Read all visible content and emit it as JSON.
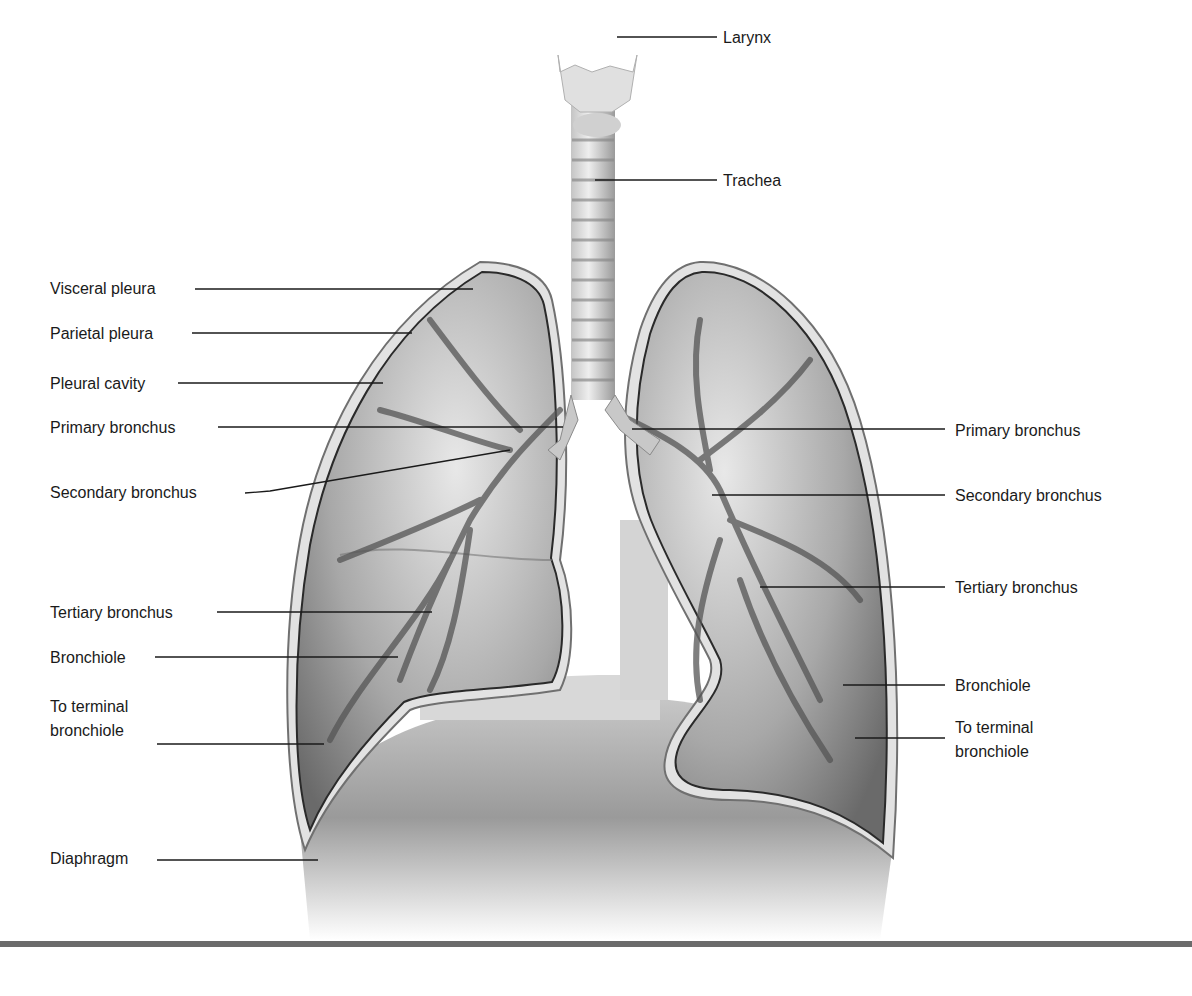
{
  "figure": {
    "colors": {
      "background": "#ffffff",
      "tissue_light": "#e4e4e4",
      "tissue_mid": "#a9a9a9",
      "tissue_dark": "#5a5a5a",
      "pleura_outline": "#2a2a2a",
      "leader_line": "#1a1a1a",
      "bottom_rule": "#6b6b6b"
    }
  },
  "labels": {
    "top": [
      {
        "text": "Larynx",
        "x": 723,
        "y": 28
      },
      {
        "text": "Trachea",
        "x": 723,
        "y": 171
      }
    ],
    "left": [
      {
        "text": "Visceral pleura",
        "x": 50,
        "y": 279
      },
      {
        "text": "Parietal pleura",
        "x": 50,
        "y": 324
      },
      {
        "text": "Pleural cavity",
        "x": 50,
        "y": 374
      },
      {
        "text": "Primary bronchus",
        "x": 50,
        "y": 418
      },
      {
        "text": "Secondary bronchus",
        "x": 50,
        "y": 483
      },
      {
        "text": "Tertiary bronchus",
        "x": 50,
        "y": 603
      },
      {
        "text": "Bronchiole",
        "x": 50,
        "y": 648
      },
      {
        "text": "To terminal",
        "x": 50,
        "y": 697
      },
      {
        "text": "bronchiole",
        "x": 50,
        "y": 721
      },
      {
        "text": "Diaphragm",
        "x": 50,
        "y": 849
      }
    ],
    "right": [
      {
        "text": "Primary bronchus",
        "x": 955,
        "y": 421
      },
      {
        "text": "Secondary bronchus",
        "x": 955,
        "y": 486
      },
      {
        "text": "Tertiary bronchus",
        "x": 955,
        "y": 578
      },
      {
        "text": "Bronchiole",
        "x": 955,
        "y": 676
      },
      {
        "text": "To terminal",
        "x": 955,
        "y": 718
      },
      {
        "text": "bronchiole",
        "x": 955,
        "y": 742
      }
    ]
  }
}
